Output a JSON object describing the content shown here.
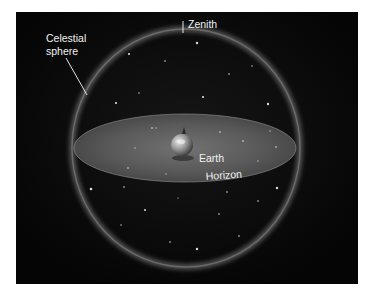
{
  "diagram": {
    "labels": {
      "zenith": "Zenith",
      "celestial_sphere_line1": "Celestial",
      "celestial_sphere_line2": "sphere",
      "earth": "Earth",
      "horizon": "Horizon"
    },
    "colors": {
      "background": "#060606",
      "page": "#ffffff",
      "sphere_glow": "#8a8a8a",
      "horizon_plane": "#6e6e6e",
      "label_text": "#f2f2f2",
      "leader_line": "#e6e6e6"
    }
  }
}
